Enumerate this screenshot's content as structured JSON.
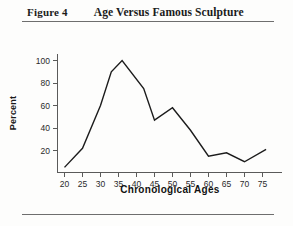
{
  "figure": {
    "label": "Figure 4",
    "title": "Age Versus Famous Sculpture"
  },
  "chart_data": {
    "type": "line",
    "title": "Age Versus Famous Sculpture",
    "xlabel": "Chronological Ages",
    "ylabel": "Percent",
    "xlim": [
      17,
      79
    ],
    "ylim": [
      0,
      108
    ],
    "xticks": [
      20,
      25,
      30,
      35,
      40,
      45,
      50,
      55,
      60,
      65,
      70,
      75
    ],
    "yticks": [
      20,
      40,
      60,
      80,
      100
    ],
    "grid": false,
    "legend": null,
    "x": [
      20,
      25,
      30,
      33,
      36,
      42,
      45,
      50,
      55,
      60,
      65,
      70,
      76
    ],
    "values": [
      5,
      22,
      60,
      90,
      100,
      75,
      47,
      58,
      38,
      15,
      18,
      10,
      21
    ],
    "series": [
      {
        "name": "Percent",
        "x": [
          20,
          25,
          30,
          33,
          36,
          42,
          45,
          50,
          55,
          60,
          65,
          70,
          76
        ],
        "values": [
          5,
          22,
          60,
          90,
          100,
          75,
          47,
          58,
          38,
          15,
          18,
          10,
          21
        ]
      }
    ],
    "line_color": "#1c1c1c"
  },
  "axis": {
    "y_label": "Percent",
    "x_label": "Chronological Ages",
    "y_tick_labels": [
      "20",
      "40",
      "60",
      "80",
      "100"
    ],
    "x_tick_labels": [
      "20",
      "25",
      "30",
      "35",
      "40",
      "45",
      "50",
      "55",
      "60",
      "65",
      "70",
      "75"
    ]
  }
}
